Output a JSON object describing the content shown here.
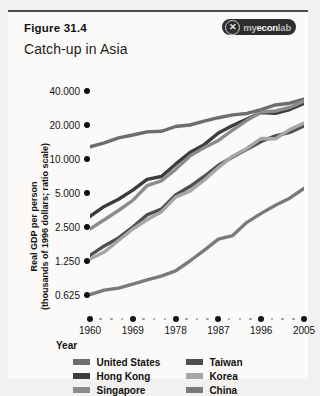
{
  "figure": {
    "number": "Figure 31.4",
    "title": "Catch-up in Asia",
    "logo_mark": "✕",
    "logo_prefix": "my",
    "logo_main": "econ",
    "logo_suffix": "lab"
  },
  "chart_data": {
    "type": "line",
    "title": "Catch-up in Asia",
    "xlabel": "Year",
    "ylabel": "Real GDP per person\n(thousands of 1996 dollars; ratio scale)",
    "yscale": "log",
    "ylim": [
      0.625,
      56
    ],
    "xlim": [
      1960,
      2005
    ],
    "grid": false,
    "legend_position": "bottom",
    "ytick_labels": [
      "40.000",
      "20.000",
      "10.000",
      "5.000",
      "2.500",
      "1.250",
      "0.625"
    ],
    "ytick_values": [
      40.0,
      20.0,
      10.0,
      5.0,
      2.5,
      1.25,
      0.625
    ],
    "xtick_labels": [
      "1960",
      "1969",
      "1978",
      "1987",
      "1996",
      "2005"
    ],
    "xtick_values": [
      1960,
      1969,
      1978,
      1987,
      1996,
      2005
    ],
    "x": [
      1960,
      1963,
      1966,
      1969,
      1972,
      1975,
      1978,
      1981,
      1984,
      1987,
      1990,
      1993,
      1996,
      1999,
      2002,
      2005
    ],
    "series": [
      {
        "name": "United States",
        "color": "#6d6d6d",
        "values": [
          12.8,
          13.9,
          15.4,
          16.3,
          17.4,
          17.6,
          19.4,
          20.0,
          21.6,
          23.2,
          24.6,
          25.3,
          27.4,
          30.1,
          31.2,
          33.9
        ]
      },
      {
        "name": "Hong Kong",
        "color": "#3c3c3c",
        "values": [
          3.1,
          3.8,
          4.4,
          5.3,
          6.6,
          7.0,
          9.0,
          11.4,
          13.4,
          17.0,
          19.8,
          22.6,
          25.8,
          25.4,
          27.4,
          31.0
        ]
      },
      {
        "name": "Singapore",
        "color": "#8c8c8c",
        "values": [
          2.4,
          2.9,
          3.5,
          4.3,
          5.8,
          6.4,
          8.1,
          10.6,
          12.6,
          14.6,
          18.0,
          22.0,
          26.0,
          26.6,
          28.6,
          32.6
        ]
      },
      {
        "name": "Taiwan",
        "color": "#4f4f4f",
        "values": [
          1.4,
          1.7,
          2.0,
          2.5,
          3.2,
          3.6,
          4.8,
          5.7,
          7.0,
          8.8,
          10.4,
          12.2,
          14.3,
          16.0,
          17.2,
          19.6
        ]
      },
      {
        "name": "Korea",
        "color": "#a6a6a6",
        "values": [
          1.3,
          1.5,
          1.9,
          2.4,
          2.9,
          3.4,
          4.6,
          5.2,
          6.5,
          8.4,
          10.6,
          12.4,
          15.2,
          15.1,
          18.2,
          20.8
        ]
      },
      {
        "name": "China",
        "color": "#7a7a7a",
        "values": [
          0.63,
          0.69,
          0.72,
          0.78,
          0.85,
          0.92,
          1.02,
          1.25,
          1.55,
          1.95,
          2.1,
          2.75,
          3.3,
          3.9,
          4.5,
          5.5
        ]
      }
    ]
  },
  "legend": {
    "left": [
      {
        "label": "United States",
        "color": "#6d6d6d"
      },
      {
        "label": "Hong Kong",
        "color": "#3c3c3c"
      },
      {
        "label": "Singapore",
        "color": "#8c8c8c"
      }
    ],
    "right": [
      {
        "label": "Taiwan",
        "color": "#4f4f4f"
      },
      {
        "label": "Korea",
        "color": "#a6a6a6"
      },
      {
        "label": "China",
        "color": "#7a7a7a"
      }
    ]
  }
}
